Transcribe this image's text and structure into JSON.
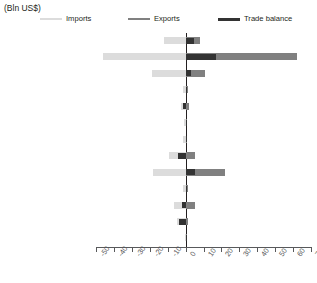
{
  "unit_label": "(Bln US$)",
  "legend": [
    {
      "name": "imports",
      "label": "Imports",
      "color": "#dcdcdc"
    },
    {
      "name": "exports",
      "label": "Exports",
      "color": "#808080"
    },
    {
      "name": "balance",
      "label": "Trade balance",
      "color": "#333333"
    }
  ],
  "colors": {
    "imports": "#dcdcdc",
    "exports": "#808080",
    "balance": "#333333",
    "axis": "#58595b",
    "zero_line": "#231f20",
    "text": "#231f20"
  },
  "chart_data": {
    "type": "bar",
    "orientation": "horizontal",
    "title": "",
    "subtitle": "",
    "xlabel": "(Bln US$)",
    "ylabel": "",
    "xlim": [
      -50,
      70
    ],
    "xticks": [
      -50,
      -40,
      -30,
      -20,
      -10,
      0,
      10,
      20,
      30,
      40,
      50,
      60,
      70
    ],
    "xtick_labels": [
      "-50",
      "-40",
      "-30",
      "-20",
      "-10",
      "0",
      "10",
      "20",
      "30",
      "40",
      "50",
      "60",
      "70"
    ],
    "grid": false,
    "legend_position": "top",
    "categories": [
      "Developed Asia-Pacific",
      "Developed Europe",
      "Developed N. America",
      "South-eastern Europe",
      "C I S",
      "Northern Africa",
      "Sub-Saharan Africa",
      "Latin Am, Caribbean",
      "Eastern Asia",
      "Southern Asia",
      "South-eastern Asia",
      "Western Asia",
      "Oceania"
    ],
    "series": [
      {
        "name": "Imports",
        "color": "#dcdcdc",
        "values": [
          -12.0,
          -46.0,
          -19.0,
          -1.5,
          -2.5,
          -0.8,
          -1.2,
          -9.0,
          -18.0,
          -1.5,
          -6.5,
          -5.0,
          -0.3
        ]
      },
      {
        "name": "Exports",
        "color": "#808080",
        "values": [
          8.0,
          62.0,
          11.0,
          1.5,
          2.0,
          0.7,
          0.9,
          5.0,
          22.0,
          1.3,
          5.0,
          1.5,
          0.2
        ]
      },
      {
        "name": "Trade balance",
        "color": "#333333",
        "values": [
          4.5,
          17.0,
          3.0,
          0.8,
          -1.5,
          0.5,
          0.6,
          -4.0,
          5.0,
          0.7,
          -2.0,
          -3.5,
          0.2
        ]
      }
    ]
  }
}
